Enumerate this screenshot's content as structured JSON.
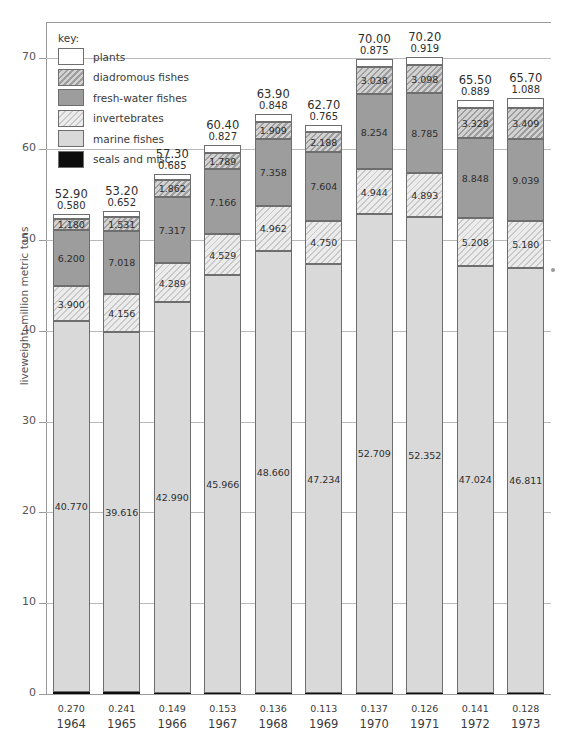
{
  "running_head": "",
  "chart_data": {
    "type": "bar",
    "subtype": "stacked",
    "title": "",
    "xlabel": "",
    "ylabel": "liveweight, million metric tons",
    "ylim": [
      0,
      74
    ],
    "yticks": [
      0,
      10,
      20,
      30,
      40,
      50,
      60,
      70
    ],
    "grid": true,
    "legend_title": "key:",
    "legend_position": "inside-top-left",
    "categories": [
      "1964",
      "1965",
      "1966",
      "1967",
      "1968",
      "1969",
      "1970",
      "1971",
      "1972",
      "1973"
    ],
    "totals": [
      "52.90",
      "53.20",
      "57.30",
      "60.40",
      "63.90",
      "62.70",
      "70.00",
      "70.20",
      "65.50",
      "65.70"
    ],
    "series": [
      {
        "name": "plants",
        "key": "plants",
        "color": "#ffffff",
        "pattern": "solid",
        "values": [
          0.58,
          0.652,
          0.685,
          0.827,
          0.848,
          0.765,
          0.875,
          0.919,
          0.889,
          1.088
        ],
        "labels": [
          "0.580",
          "0.652",
          "0.685",
          "0.827",
          "0.848",
          "0.765",
          "0.875",
          "0.919",
          "0.889",
          "1.088"
        ],
        "label_placement": "above-bar"
      },
      {
        "name": "diadromous fishes",
        "key": "diadromous",
        "color": "#b4b4b4",
        "pattern": "diagonal-hatch-dark",
        "values": [
          1.18,
          1.531,
          1.862,
          1.789,
          1.909,
          2.188,
          3.038,
          3.098,
          3.328,
          3.409
        ],
        "labels": [
          "1.180",
          "1.531",
          "1.862",
          "1.789",
          "1.909",
          "2.188",
          "3.038",
          "3.098",
          "3.328",
          "3.409"
        ],
        "label_placement": "in-segment"
      },
      {
        "name": "fresh-water fishes",
        "key": "freshwater",
        "color": "#9d9d9d",
        "pattern": "solid",
        "values": [
          6.2,
          7.018,
          7.317,
          7.166,
          7.358,
          7.604,
          8.254,
          8.785,
          8.848,
          9.039
        ],
        "labels": [
          "6.200",
          "7.018",
          "7.317",
          "7.166",
          "7.358",
          "7.604",
          "8.254",
          "8.785",
          "8.848",
          "9.039"
        ],
        "label_placement": "in-segment"
      },
      {
        "name": "invertebrates",
        "key": "invertebrates",
        "color": "#dcdcdc",
        "pattern": "diagonal-hatch-light",
        "values": [
          3.9,
          4.156,
          4.289,
          4.529,
          4.962,
          4.75,
          4.944,
          4.893,
          5.208,
          5.18
        ],
        "labels": [
          "3.900",
          "4.156",
          "4.289",
          "4.529",
          "4.962",
          "4.750",
          "4.944",
          "4.893",
          "5.208",
          "5.180"
        ],
        "label_placement": "in-segment"
      },
      {
        "name": "marine fishes",
        "key": "marine",
        "color": "#d9d9d9",
        "pattern": "solid",
        "values": [
          40.77,
          39.616,
          42.99,
          45.966,
          48.66,
          47.234,
          52.709,
          52.352,
          47.024,
          46.811
        ],
        "labels": [
          "40.770",
          "39.616",
          "42.990",
          "45.966",
          "48.660",
          "47.234",
          "52.709",
          "52.352",
          "47.024",
          "46.811"
        ],
        "label_placement": "in-segment"
      },
      {
        "name": "seals and misc.",
        "key": "seals",
        "color": "#0d0d0d",
        "pattern": "solid",
        "values": [
          0.27,
          0.241,
          0.149,
          0.153,
          0.136,
          0.113,
          0.137,
          0.126,
          0.141,
          0.128
        ],
        "labels": [
          "0.270",
          "0.241",
          "0.149",
          "0.153",
          "0.136",
          "0.113",
          "0.137",
          "0.126",
          "0.141",
          "0.128"
        ],
        "label_placement": "below-axis"
      }
    ]
  },
  "legend": {
    "title": "key:",
    "items": [
      {
        "label": "plants"
      },
      {
        "label": "diadromous fishes"
      },
      {
        "label": "fresh-water fishes"
      },
      {
        "label": "invertebrates"
      },
      {
        "label": "marine fishes"
      },
      {
        "label": "seals and misc."
      }
    ]
  }
}
